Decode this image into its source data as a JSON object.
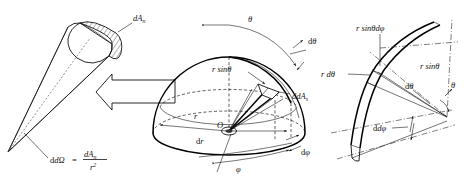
{
  "figure": {
    "background_color": "#ffffff",
    "line_color": "#111111",
    "panels": [
      {
        "id": "cone",
        "name": "solid-angle-cone",
        "labels": {
          "cap_area": "dA",
          "cap_area_sub": "n",
          "formula_lhs": "dΩ",
          "formula_eq": "=",
          "formula_num": "dA",
          "formula_num_sub": "n",
          "formula_den": "r",
          "formula_den_exp": "2"
        }
      },
      {
        "id": "hemisphere",
        "name": "hemisphere-spherical-coordinates",
        "labels": {
          "theta": "θ",
          "d_theta": "dθ",
          "r_sin_theta": "r sinθ",
          "dA_s": "dA",
          "dA_s_sub": "s",
          "r": "r",
          "origin": "O",
          "dA": "dA",
          "phi": "φ",
          "d_phi": "dφ"
        }
      },
      {
        "id": "detail",
        "name": "surface-element-detail",
        "labels": {
          "r_sin_theta_d_phi": "r sinθdφ",
          "r_d_theta": "r dθ",
          "r_sin_theta": "r sinθ",
          "d_theta": "dθ",
          "theta": "θ",
          "d_phi": "dφ"
        }
      }
    ],
    "arrow": {
      "name": "block-arrow-left",
      "direction": "left"
    }
  }
}
